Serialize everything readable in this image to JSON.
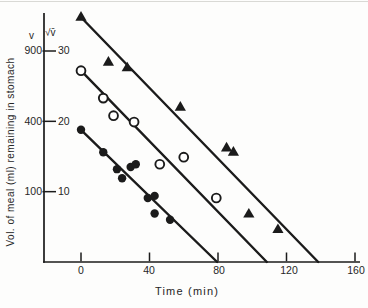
{
  "figure": {
    "background": "#fdfdfc",
    "ink_color": "#1b1b1b"
  },
  "chart_data": {
    "type": "scatter",
    "title": "",
    "xlabel": "Time (min)",
    "ylabel": "Vol. of meal (ml) remaining in stomach",
    "left_scale_symbol": "v",
    "right_scale_symbol": "√v̄",
    "x_ticks": [
      0,
      40,
      80,
      120,
      160
    ],
    "y_ticks": [
      {
        "v": 900,
        "sqrt_v": 30
      },
      {
        "v": 400,
        "sqrt_v": 20
      },
      {
        "v": 100,
        "sqrt_v": 10
      }
    ],
    "x_axis_range_min": [
      -22,
      163
    ],
    "y_axis_range_sqrt_v": [
      0,
      35.4
    ],
    "grid": false,
    "legend": "none",
    "series": [
      {
        "name": "triangle-series",
        "marker": "filled-triangle",
        "points": [
          [
            0,
            34.8
          ],
          [
            16,
            28.4
          ],
          [
            27,
            27.6
          ],
          [
            58,
            22.0
          ],
          [
            85,
            16.2
          ],
          [
            89,
            15.6
          ],
          [
            98,
            6.8
          ],
          [
            115,
            4.6
          ]
        ],
        "line": [
          [
            0,
            34.8
          ],
          [
            138.5,
            0
          ]
        ]
      },
      {
        "name": "open-circle-series",
        "marker": "open-circle",
        "points": [
          [
            0,
            27.2
          ],
          [
            13,
            23.3
          ],
          [
            19,
            20.8
          ],
          [
            31,
            19.9
          ],
          [
            46,
            13.9
          ],
          [
            60,
            14.9
          ],
          [
            79,
            9.1
          ]
        ],
        "line": [
          [
            0,
            27.2
          ],
          [
            108.5,
            0
          ]
        ]
      },
      {
        "name": "filled-circle-series",
        "marker": "filled-circle",
        "points": [
          [
            0,
            18.8
          ],
          [
            13,
            15.6
          ],
          [
            21,
            13.2
          ],
          [
            24,
            11.9
          ],
          [
            29,
            13.5
          ],
          [
            32,
            13.9
          ],
          [
            39,
            9.1
          ],
          [
            43,
            9.4
          ],
          [
            43,
            6.9
          ],
          [
            52,
            6.0
          ]
        ],
        "line": [
          [
            0,
            18.8
          ],
          [
            79.5,
            0
          ]
        ]
      }
    ]
  }
}
